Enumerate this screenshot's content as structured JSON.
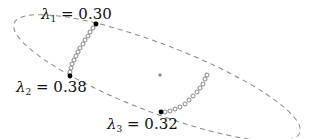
{
  "diagram": {
    "ellipse": {
      "cx": 157,
      "cy": 78,
      "rx": 153,
      "ry": 34,
      "rotation_deg": 21,
      "stroke": "#888888",
      "dash": "5,4"
    },
    "center_marker": {
      "x": 160,
      "y": 75,
      "glyph": "+"
    },
    "points": [
      {
        "id": "lambda1",
        "x": 96,
        "y": 24
      },
      {
        "id": "lambda2",
        "x": 70,
        "y": 76
      },
      {
        "id": "lambda3",
        "x": 161,
        "y": 112
      }
    ],
    "labels": [
      {
        "symbol": "λ",
        "subscript": "1",
        "text": " = 0.30",
        "value": 0.3
      },
      {
        "symbol": "λ",
        "subscript": "2",
        "text": " = 0.38",
        "value": 0.38
      },
      {
        "symbol": "λ",
        "subscript": "3",
        "text": " = 0.32",
        "value": 0.32
      }
    ],
    "trajectory_1": [
      [
        96,
        24
      ],
      [
        93,
        28
      ],
      [
        90,
        32
      ],
      [
        88,
        36
      ],
      [
        85,
        40
      ],
      [
        83,
        44
      ],
      [
        80,
        48
      ],
      [
        78,
        52
      ],
      [
        76,
        56
      ],
      [
        74,
        60
      ],
      [
        72,
        64
      ],
      [
        71,
        68
      ],
      [
        70,
        72
      ]
    ],
    "trajectory_2": [
      [
        165,
        112
      ],
      [
        170,
        111
      ],
      [
        175,
        109
      ],
      [
        180,
        107
      ],
      [
        185,
        104
      ],
      [
        189,
        100
      ],
      [
        193,
        96
      ],
      [
        197,
        92
      ],
      [
        200,
        88
      ],
      [
        203,
        84
      ],
      [
        205,
        79
      ],
      [
        207,
        75
      ]
    ]
  }
}
